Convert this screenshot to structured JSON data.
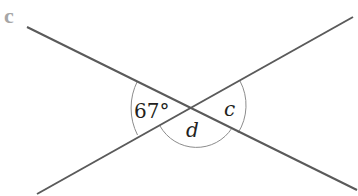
{
  "part_label": "c",
  "colors": {
    "line": "#5a5a5a",
    "arc": "#8c8c8c",
    "text": "#231f20",
    "part_label": "#a6a6a6"
  },
  "diagram": {
    "type": "intersecting-lines-angles",
    "intersection": [
      192,
      108
    ],
    "lines": [
      {
        "from": [
          27,
          27
        ],
        "to": [
          357,
          190
        ]
      },
      {
        "from": [
          37,
          194
        ],
        "to": [
          353,
          17
        ]
      }
    ],
    "angles": [
      {
        "position": "left",
        "label": "67°"
      },
      {
        "position": "right",
        "label": "c"
      },
      {
        "position": "bottom",
        "label": "d"
      }
    ]
  }
}
